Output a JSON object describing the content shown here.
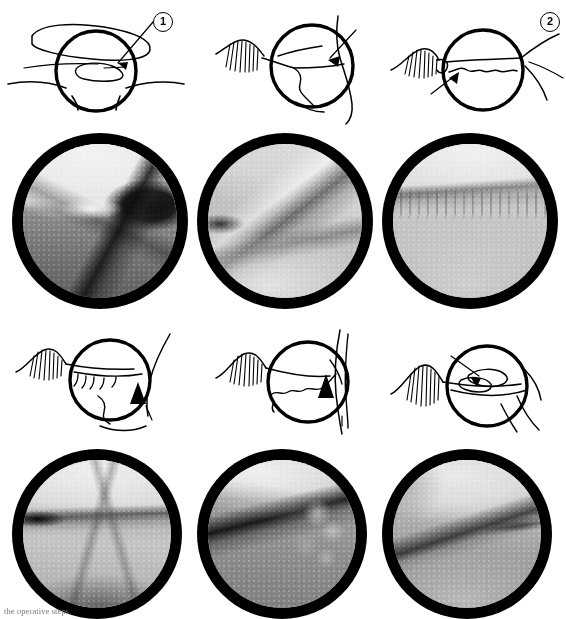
{
  "figure": {
    "kind": "arthroscopic-procedure-sequence",
    "caption": "the  operative steps.",
    "rows": 2,
    "columns": 3,
    "panel_count": 6,
    "photo_style": "grayscale arthroscopic view in thick black circular vignette",
    "schematic_style": "black line drawing of joint anatomy with magnifying circle and leader-line callout"
  },
  "colors": {
    "ink": "#000000",
    "paper": "#ffffff",
    "vignette": "#000000",
    "tissue_light": "#d8d8d8",
    "tissue_mid": "#9a9a9a",
    "tissue_dark": "#4a4a4a",
    "caption_gray": "#7b7b7b"
  },
  "panels": [
    {
      "id": "panel-1",
      "number": "1",
      "callout_label": "1",
      "schematic_name": "schematic-step-1",
      "photo_name": "arthroscopic-photo-step-1",
      "arrow_direction": "left",
      "callout_position": "top-right"
    },
    {
      "id": "panel-2",
      "number": "2",
      "callout_label": "2",
      "schematic_name": "schematic-step-2",
      "photo_name": "arthroscopic-photo-step-2",
      "arrow_direction": "down-left",
      "callout_position": "top-right"
    },
    {
      "id": "panel-3",
      "number": "3",
      "callout_label": "3",
      "schematic_name": "schematic-step-3",
      "photo_name": "arthroscopic-photo-step-3",
      "arrow_direction": "up-right",
      "callout_position": "bottom-left"
    },
    {
      "id": "panel-4",
      "number": "4",
      "callout_label": "4",
      "schematic_name": "schematic-step-4",
      "photo_name": "arthroscopic-photo-step-4",
      "arrow_direction": "up",
      "callout_position": "bottom-right"
    },
    {
      "id": "panel-5",
      "number": "5",
      "callout_label": "5",
      "schematic_name": "schematic-step-5",
      "photo_name": "arthroscopic-photo-step-5",
      "arrow_direction": "up",
      "callout_position": "bottom-right"
    },
    {
      "id": "panel-6",
      "number": "6",
      "callout_label": "6",
      "schematic_name": "schematic-step-6",
      "photo_name": "arthroscopic-photo-step-6",
      "arrow_direction": "down-right",
      "callout_position": "top-left"
    }
  ]
}
